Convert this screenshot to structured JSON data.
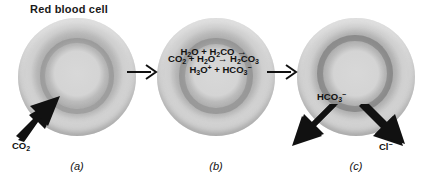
{
  "figure": {
    "title": "Red blood cell",
    "background_color": "#ffffff",
    "cell_color": "#cccccc",
    "arrow_color": "#111111"
  },
  "panels": [
    {
      "id": "a",
      "caption": "(a)",
      "equation_lines": [
        "CO2 + H2O → H2CO3"
      ],
      "transport": [
        {
          "species": "CO2",
          "direction": "in",
          "label": "CO",
          "sub": "2",
          "sup": ""
        }
      ]
    },
    {
      "id": "b",
      "caption": "(b)",
      "equation_lines": [
        "H2O + H2CO →",
        "H3O+ + HCO3-"
      ],
      "transport": []
    },
    {
      "id": "c",
      "caption": "(c)",
      "equation_lines": [],
      "transport": [
        {
          "species": "HCO3-",
          "direction": "out",
          "label": "HCO",
          "sub": "3",
          "sup": "−"
        },
        {
          "species": "Cl-",
          "direction": "in",
          "label": "Cl",
          "sub": "",
          "sup": "−"
        }
      ]
    }
  ],
  "equations": {
    "a": {
      "reactant1": "CO",
      "reactant1_sub": "2",
      "plus": "+",
      "reactant2": "H",
      "reactant2_sub": "2",
      "reactant2_rest": "O",
      "arrow": "→",
      "product": "H",
      "product_sub": "2",
      "product_rest": "CO",
      "product_sub2": "3"
    },
    "b": {
      "line1_a": "H",
      "line1_a_sub": "2",
      "line1_a_rest": "O",
      "line1_plus": "+",
      "line1_b": "H",
      "line1_b_sub": "2",
      "line1_b_rest": "CO",
      "line1_arrow": "→",
      "line2_a": "H",
      "line2_a_sub": "3",
      "line2_a_rest": "O",
      "line2_a_sup": "+",
      "line2_plus": "+",
      "line2_b": "HCO",
      "line2_b_sub": "3",
      "line2_b_sup": "−"
    }
  },
  "labels": {
    "co2": "CO",
    "co2_sub": "2",
    "hco3": "HCO",
    "hco3_sub": "3",
    "hco3_sup": "−",
    "cl": "Cl",
    "cl_sup": "−"
  },
  "captions": {
    "a": "(a)",
    "b": "(b)",
    "c": "(c)"
  }
}
